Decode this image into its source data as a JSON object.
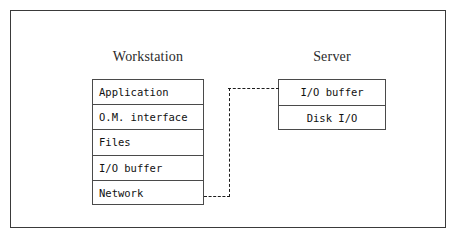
{
  "figure": {
    "kind": "block-diagram",
    "background_color": "#ffffff",
    "frame_color": "#3a3a3a",
    "box_border_color": "#4a4a4a",
    "connector_color": "#1c1c1c",
    "connector_style": "dashed"
  },
  "columns": [
    {
      "id": "workstation",
      "title": "Workstation",
      "text_align": "left",
      "layers": [
        {
          "label": "Application"
        },
        {
          "label": "O.M. interface"
        },
        {
          "label": "Files"
        },
        {
          "label": "I/O buffer"
        },
        {
          "label": "Network"
        }
      ]
    },
    {
      "id": "server",
      "title": "Server",
      "text_align": "center",
      "layers": [
        {
          "label": "I/O buffer"
        },
        {
          "label": "Disk I/O"
        }
      ]
    }
  ],
  "connector": {
    "name": "network-link",
    "from_layer": "Network",
    "to_layer": "I/O buffer",
    "style": "dashed",
    "segments": [
      "horizontal-right",
      "vertical-up",
      "horizontal-right"
    ]
  }
}
